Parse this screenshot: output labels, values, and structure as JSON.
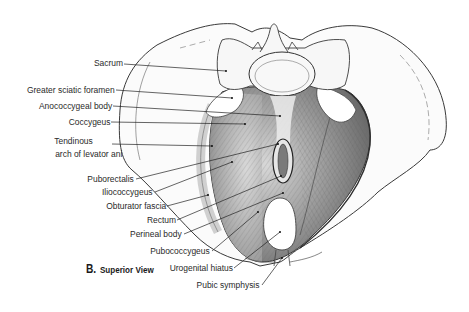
{
  "figure": {
    "caption_letter": "B.",
    "caption_text": "Superior View",
    "labels": [
      {
        "id": "sacrum",
        "text": "Sacrum"
      },
      {
        "id": "greater-sciatic-foramen",
        "text": "Greater sciatic foramen"
      },
      {
        "id": "anococcygeal-body",
        "text": "Anococcygeal body"
      },
      {
        "id": "coccygeus",
        "text": "Coccygeus"
      },
      {
        "id": "tendinous-arch-1",
        "text": "Tendinous"
      },
      {
        "id": "tendinous-arch-2",
        "text": "arch of levator ani"
      },
      {
        "id": "puborectalis",
        "text": "Puborectalis"
      },
      {
        "id": "iliococcygeus",
        "text": "Iliococcygeus"
      },
      {
        "id": "obturator-fascia",
        "text": "Obturator fascia"
      },
      {
        "id": "rectum",
        "text": "Rectum"
      },
      {
        "id": "perineal-body",
        "text": "Perineal body"
      },
      {
        "id": "pubococcygeus",
        "text": "Pubococcygeus"
      },
      {
        "id": "urogenital-hiatus",
        "text": "Urogenital hiatus"
      },
      {
        "id": "pubic-symphysis",
        "text": "Pubic symphysis"
      }
    ],
    "colors": {
      "outline": "#3a3a3a",
      "muscle_dark": "#6e6e6e",
      "muscle_mid": "#a8a8a8",
      "muscle_light": "#d4d4d4",
      "bone": "#f6f6f6",
      "leader": "#222222"
    }
  }
}
